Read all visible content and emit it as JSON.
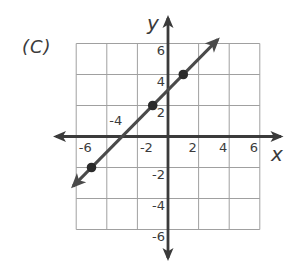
{
  "figure": {
    "option_label": "(C)"
  },
  "chart_data": {
    "type": "line",
    "title": "",
    "xlabel": "x",
    "ylabel": "y",
    "xlim": [
      -7,
      7
    ],
    "ylim": [
      -7,
      7
    ],
    "grid": "on",
    "grid_min": -6,
    "grid_max": 6,
    "grid_step": 2,
    "x_ticks": [
      {
        "value": -6,
        "label": "-6",
        "side": "below"
      },
      {
        "value": -4,
        "label": "-4",
        "side": "above"
      },
      {
        "value": -2,
        "label": "-2",
        "side": "below"
      },
      {
        "value": 2,
        "label": "2",
        "side": "below"
      },
      {
        "value": 4,
        "label": "4",
        "side": "below"
      },
      {
        "value": 6,
        "label": "6",
        "side": "below"
      }
    ],
    "y_ticks": [
      {
        "value": 6,
        "label": "6"
      },
      {
        "value": 4,
        "label": "4"
      },
      {
        "value": 2,
        "label": "2"
      },
      {
        "value": -2,
        "label": "-2"
      },
      {
        "value": -4,
        "label": "-4"
      },
      {
        "value": -6,
        "label": "-6"
      }
    ],
    "series": [
      {
        "name": "plotted-line",
        "equation": "y = x + 3",
        "slope": 1,
        "intercept": 3,
        "drawn_x_range": [
          -6.2,
          3.25
        ],
        "marked_points": [
          [
            -5,
            -2
          ],
          [
            -1,
            2
          ],
          [
            1,
            4
          ]
        ]
      }
    ],
    "colors": {
      "background": "#ffffff",
      "grid": "#a0a0a0",
      "axis": "#3b3b3b",
      "line": "#4a4a4a",
      "point": "#2b2b2b",
      "text": "#3b3b3b"
    }
  }
}
